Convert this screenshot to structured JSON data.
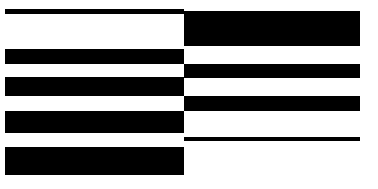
{
  "image": {
    "title": "Abstract horizontal bar pattern",
    "width": 378,
    "height": 189,
    "background_color": "#ffffff",
    "bar_color": "#000000"
  },
  "layout": {
    "columns": 2,
    "split_x": 184,
    "left_column_start_x": 5,
    "left_column_end_x": 184,
    "right_column_start_x": 184,
    "right_column_end_x": 360
  },
  "bars": {
    "left": [
      {
        "name": "left-bar-1",
        "x": 5,
        "y": 9,
        "width": 179,
        "height": 5
      },
      {
        "name": "left-bar-2",
        "x": 5,
        "y": 49,
        "width": 179,
        "height": 15
      },
      {
        "name": "left-bar-3",
        "x": 5,
        "y": 77,
        "width": 179,
        "height": 19
      },
      {
        "name": "left-bar-4",
        "x": 5,
        "y": 111,
        "width": 179,
        "height": 22
      },
      {
        "name": "left-bar-5",
        "x": 5,
        "y": 147,
        "width": 179,
        "height": 28
      }
    ],
    "right": [
      {
        "name": "right-bar-1",
        "x": 184,
        "y": 11,
        "width": 176,
        "height": 35
      },
      {
        "name": "right-bar-2",
        "x": 184,
        "y": 64,
        "width": 176,
        "height": 14
      },
      {
        "name": "right-bar-3",
        "x": 184,
        "y": 96,
        "width": 176,
        "height": 15
      },
      {
        "name": "right-bar-4",
        "x": 184,
        "y": 137,
        "width": 176,
        "height": 4
      }
    ]
  }
}
